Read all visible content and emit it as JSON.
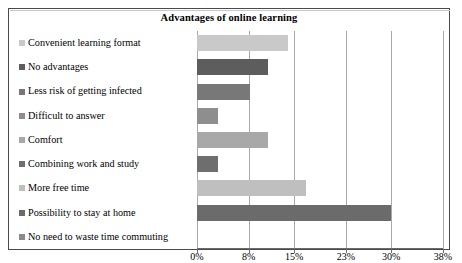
{
  "chart_data": {
    "type": "bar",
    "orientation": "horizontal",
    "title": "Advantages of online learning",
    "xlabel": "",
    "ylabel": "",
    "categories": [
      "Convenient learning format",
      "No advantages",
      "Less risk of getting infected",
      "Difficult to answer",
      "Comfort",
      "Combining work and study",
      "More free time",
      "Possibility to stay at home",
      "No need to waste time commuting"
    ],
    "values": [
      14,
      11,
      8.2,
      3.2,
      10.9,
      3.2,
      16.8,
      30,
      0
    ],
    "value_unit": "%",
    "xlim": [
      0,
      38
    ],
    "xticks": [
      0,
      8,
      15,
      23,
      30,
      38
    ],
    "xtick_labels": [
      "0%",
      "8%",
      "15%",
      "23%",
      "30%",
      "38%"
    ],
    "grid": true,
    "legend_position": "left",
    "series_colors": [
      "#c9c9c9",
      "#5d5d5d",
      "#787878",
      "#8e8e8e",
      "#a8a8a8",
      "#6e6e6e",
      "#bfbfbf",
      "#6b6b6b",
      "#8a8a8a"
    ],
    "legend_entries": [
      {
        "label": "Convenient learning format",
        "color": "#c9c9c9"
      },
      {
        "label": "No advantages",
        "color": "#5d5d5d"
      },
      {
        "label": "Less risk of getting infected",
        "color": "#787878"
      },
      {
        "label": "Difficult to answer",
        "color": "#8e8e8e"
      },
      {
        "label": "Comfort",
        "color": "#a8a8a8"
      },
      {
        "label": "Combining work and study",
        "color": "#6e6e6e"
      },
      {
        "label": "More free time",
        "color": "#bfbfbf"
      },
      {
        "label": "Possibility to stay at home",
        "color": "#6b6b6b"
      },
      {
        "label": "No need to waste time commuting",
        "color": "#8a8a8a"
      }
    ]
  }
}
